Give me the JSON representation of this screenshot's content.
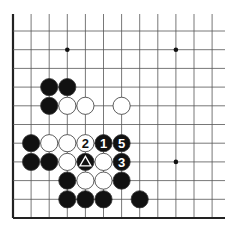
{
  "board": {
    "title": "Go problem diagram (lower-left corner)",
    "origin_x": 13,
    "origin_y": 31,
    "spacing_x": 18.1,
    "spacing_y": 18.7,
    "cols": 12,
    "rows": 11,
    "edges": [
      "left",
      "bottom"
    ],
    "star_points": [
      [
        3,
        1
      ],
      [
        9,
        1
      ],
      [
        9,
        7
      ]
    ],
    "stones": [
      {
        "c": 2,
        "r": 3,
        "color": "black",
        "label": ""
      },
      {
        "c": 3,
        "r": 3,
        "color": "black",
        "label": ""
      },
      {
        "c": 2,
        "r": 4,
        "color": "black",
        "label": ""
      },
      {
        "c": 3,
        "r": 4,
        "color": "white",
        "label": ""
      },
      {
        "c": 4,
        "r": 4,
        "color": "white",
        "label": ""
      },
      {
        "c": 6,
        "r": 4,
        "color": "white",
        "label": ""
      },
      {
        "c": 1,
        "r": 6,
        "color": "black",
        "label": ""
      },
      {
        "c": 2,
        "r": 6,
        "color": "white",
        "label": ""
      },
      {
        "c": 3,
        "r": 6,
        "color": "white",
        "label": ""
      },
      {
        "c": 4,
        "r": 6,
        "color": "white",
        "label": "2"
      },
      {
        "c": 5,
        "r": 6,
        "color": "black",
        "label": "1"
      },
      {
        "c": 6,
        "r": 6,
        "color": "black",
        "label": "5"
      },
      {
        "c": 1,
        "r": 7,
        "color": "black",
        "label": ""
      },
      {
        "c": 2,
        "r": 7,
        "color": "black",
        "label": ""
      },
      {
        "c": 3,
        "r": 7,
        "color": "white",
        "label": ""
      },
      {
        "c": 4,
        "r": 7,
        "color": "black",
        "label": "triangle"
      },
      {
        "c": 5,
        "r": 7,
        "color": "white",
        "label": ""
      },
      {
        "c": 6,
        "r": 7,
        "color": "black",
        "label": "3"
      },
      {
        "c": 3,
        "r": 8,
        "color": "black",
        "label": ""
      },
      {
        "c": 4,
        "r": 8,
        "color": "white",
        "label": ""
      },
      {
        "c": 5,
        "r": 8,
        "color": "white",
        "label": ""
      },
      {
        "c": 6,
        "r": 8,
        "color": "black",
        "label": ""
      },
      {
        "c": 3,
        "r": 9,
        "color": "black",
        "label": ""
      },
      {
        "c": 4,
        "r": 9,
        "color": "black",
        "label": ""
      },
      {
        "c": 5,
        "r": 9,
        "color": "black",
        "label": ""
      },
      {
        "c": 7,
        "r": 9,
        "color": "black",
        "label": ""
      }
    ],
    "colors": {
      "line": "#555555",
      "edge": "#222222",
      "black": "#111111",
      "white": "#ffffff"
    }
  }
}
